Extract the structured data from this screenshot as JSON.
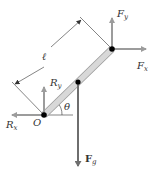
{
  "diagram": {
    "type": "free-body diagram of a rod pivoted at O",
    "labels": {
      "length": "ℓ",
      "angle": "θ",
      "pivot": "O",
      "Fy_main": "F",
      "Fy_sub": "y",
      "Fx_main": "F",
      "Fx_sub": "x",
      "Ry_main": "R",
      "Ry_sub": "y",
      "Rx_main": "R",
      "Rx_sub": "x",
      "Fg_main": "F",
      "Fg_sub": "g"
    },
    "colors": {
      "rod": "#d6d6d6",
      "rod_edge": "#9a9a9a",
      "arrow": "#9c9c9c",
      "weight_arrow": "#7a7a7a",
      "dot": "#000000",
      "line": "#333333"
    }
  }
}
